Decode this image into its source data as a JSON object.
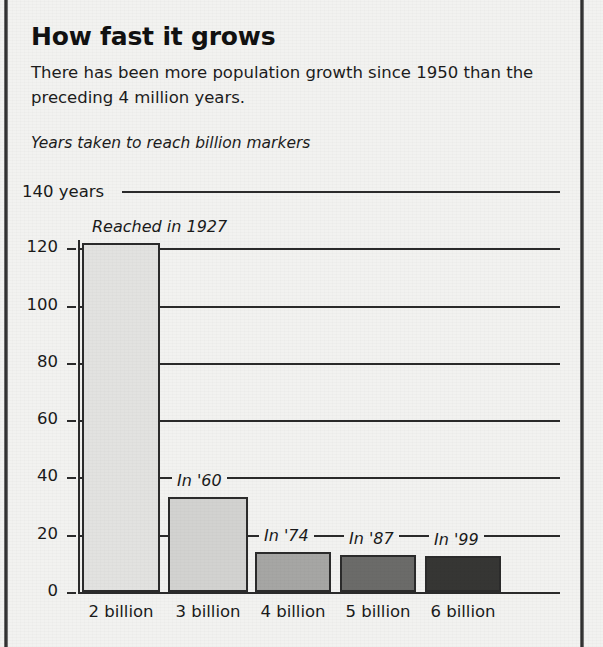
{
  "headline": "How fast it grows",
  "deck": "There has been more population growth since 1950 than the preceding 4 million years.",
  "subtitle": "Years taken to reach billion markers",
  "chart_data": {
    "type": "bar",
    "title": "Years taken to reach billion markers",
    "xlabel": "",
    "ylabel": "years",
    "ylim": [
      0,
      140
    ],
    "yticks": [
      0,
      20,
      40,
      60,
      80,
      100,
      120,
      140
    ],
    "ytick_labels": [
      "0",
      "20",
      "40",
      "60",
      "80",
      "100",
      "120",
      "140 years"
    ],
    "top_axis_label": "140 years",
    "grid": true,
    "legend": "none",
    "categories": [
      "2 billion",
      "3 billion",
      "4 billion",
      "5 billion",
      "6 billion"
    ],
    "values": [
      122,
      33,
      14,
      13,
      12.5
    ],
    "annotations": [
      "Reached in 1927",
      "In '60",
      "In '74",
      "In '87",
      "In '99"
    ],
    "bar_colors": [
      "#e2e2e0",
      "#d2d2d0",
      "#a6a6a4",
      "#6b6b69",
      "#363634"
    ]
  }
}
